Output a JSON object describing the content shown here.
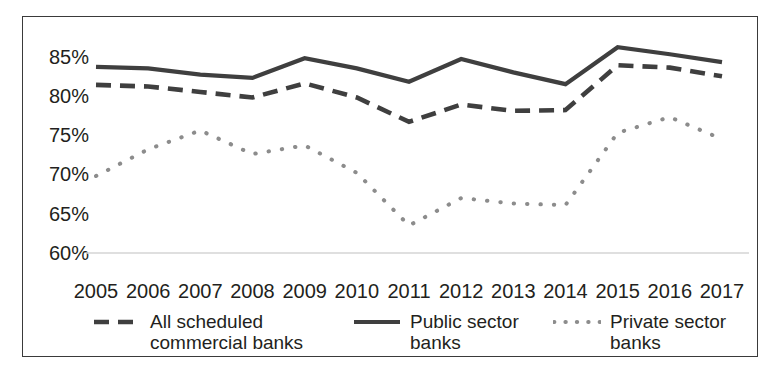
{
  "chart_data": {
    "type": "line",
    "title": "",
    "subtitle": "",
    "xlabel": "",
    "ylabel": "",
    "categories": [
      "2005",
      "2006",
      "2007",
      "2008",
      "2009",
      "2010",
      "2011",
      "2012",
      "2013",
      "2014",
      "2015",
      "2016",
      "2017"
    ],
    "x": [
      2005,
      2006,
      2007,
      2008,
      2009,
      2010,
      2011,
      2012,
      2013,
      2014,
      2015,
      2016,
      2017
    ],
    "ylim": [
      60,
      87.5
    ],
    "y_ticks": [
      60,
      65,
      70,
      75,
      80,
      85
    ],
    "y_tick_labels": [
      "60%",
      "65%",
      "70%",
      "75%",
      "80%",
      "85%"
    ],
    "grid": "only-baseline-60",
    "legend_position": "bottom",
    "value_unit": "%",
    "series": [
      {
        "name": "All scheduled commercial banks",
        "style": "dashed",
        "color": "#3f3f3f",
        "values": [
          81.4,
          81.2,
          80.5,
          79.8,
          81.6,
          79.8,
          76.7,
          78.9,
          78.1,
          78.2,
          83.9,
          83.6,
          82.5
        ]
      },
      {
        "name": "Public sector banks",
        "style": "solid",
        "color": "#3f3f3f",
        "values": [
          83.7,
          83.5,
          82.7,
          82.3,
          84.8,
          83.5,
          81.8,
          84.7,
          83.0,
          81.5,
          86.2,
          85.3,
          84.3
        ]
      },
      {
        "name": "Private sector banks",
        "style": "dotted",
        "color": "#8c8c8c",
        "values": [
          69.8,
          73.2,
          75.6,
          72.6,
          73.7,
          70.2,
          63.5,
          67.0,
          66.3,
          66.1,
          75.3,
          77.3,
          74.5
        ]
      }
    ]
  },
  "legend": {
    "entries": [
      {
        "label": "All scheduled\ncommercial banks",
        "style": "dashed",
        "color": "#3f3f3f"
      },
      {
        "label": "Public sector\nbanks",
        "style": "solid",
        "color": "#3f3f3f"
      },
      {
        "label": "Private sector\nbanks",
        "style": "dotted",
        "color": "#8c8c8c"
      }
    ]
  },
  "frame": {
    "border_color": "#3a3a3a",
    "background": "#ffffff",
    "baseline_color": "#d4d4d4"
  }
}
